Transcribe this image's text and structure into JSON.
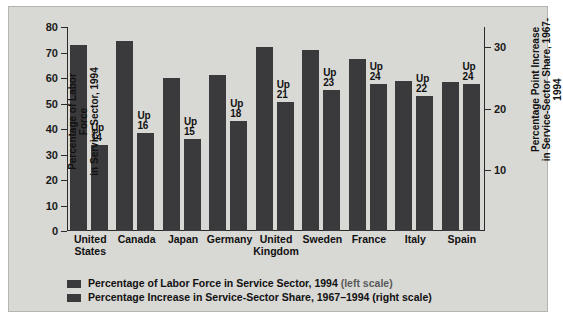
{
  "chart_data": {
    "type": "bar",
    "title": "",
    "categories": [
      "United States",
      "Canada",
      "Japan",
      "Germany",
      "United Kingdom",
      "Sweden",
      "France",
      "Italy",
      "Spain"
    ],
    "series": [
      {
        "name": "Percentage of Labor Force in Service Sector, 1994",
        "axis": "left",
        "values": [
          73,
          74.5,
          60,
          61,
          72,
          71,
          67.5,
          59,
          58.5
        ]
      },
      {
        "name": "Percentage Increase in Service-Sector Share, 1967-1994",
        "axis": "right",
        "values": [
          14,
          16,
          15,
          18,
          21,
          23,
          24,
          22,
          24
        ],
        "point_labels": [
          "Up\n14",
          "Up\n16",
          "Up\n15",
          "Up\n18",
          "Up\n21",
          "Up\n23",
          "Up\n24",
          "Up\n22",
          "Up\n24"
        ],
        "label_prefix": "Up"
      }
    ],
    "ylabel": "Percentage of Labor Force\nin Service Sector, 1994",
    "ylabel_right": "Percentage Point Increase\nin Service-Sector Share, 1967-1994",
    "xlabel": "",
    "ylim": [
      0,
      80
    ],
    "yticks": [
      0,
      10,
      20,
      30,
      40,
      50,
      60,
      70,
      80
    ],
    "ylim_right": [
      0,
      33.33
    ],
    "yticks_right": [
      10,
      20,
      30
    ],
    "grid": false,
    "legend_position": "bottom-left",
    "legend": [
      {
        "label": "Percentage of Labor Force in Service Sector, 1994",
        "scale": "(left scale)",
        "color": "#3a3a3c"
      },
      {
        "label": "Percentage Increase in Service-Sector Share, 1967–1994",
        "scale": "(right scale)",
        "color": "#3a3a3c"
      }
    ],
    "colors": {
      "series1": "#3a3a3c",
      "series2": "#3a3a3c",
      "background": "#d8d8d4",
      "axis": "#2b2b2b"
    }
  }
}
